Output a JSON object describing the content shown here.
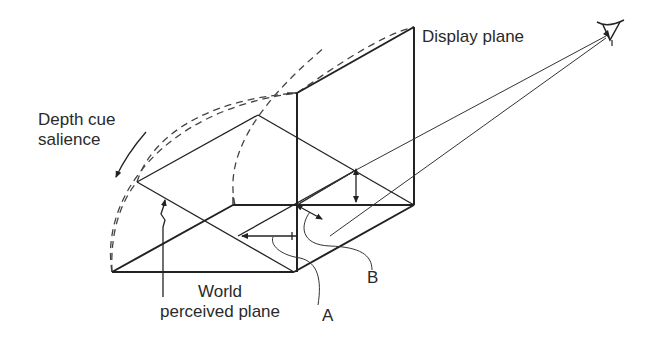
{
  "diagram": {
    "labels": {
      "display_plane": "Display plane",
      "depth_cue_line1": "Depth cue",
      "depth_cue_line2": "salience",
      "world_line1": "World",
      "world_line2": "perceived plane",
      "label_a": "A",
      "label_b": "B"
    },
    "icons": {
      "eye": "eye-icon"
    },
    "colors": {
      "ink": "#222222",
      "background": "#ffffff"
    }
  }
}
